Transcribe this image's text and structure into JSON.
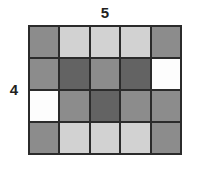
{
  "figure": {
    "kind": "rectangular-array-grid",
    "columns_label": "5",
    "rows_label": "4",
    "rows": 4,
    "columns": 5,
    "total_cells": 20,
    "gridline_color": "#2b2b2b",
    "background_color": "#ffffff",
    "label_color": "#231f20",
    "palette": {
      "white": "#fdfdfd",
      "light_gray": "#d2d2d2",
      "medium_gray": "#8c8c8c",
      "dark_gray": "#636363"
    },
    "cells": [
      [
        {
          "shade": "medium_gray",
          "color": "#8c8c8c"
        },
        {
          "shade": "light_gray",
          "color": "#d2d2d2"
        },
        {
          "shade": "light_gray",
          "color": "#d2d2d2"
        },
        {
          "shade": "light_gray",
          "color": "#d2d2d2"
        },
        {
          "shade": "medium_gray",
          "color": "#8c8c8c"
        }
      ],
      [
        {
          "shade": "medium_gray",
          "color": "#8c8c8c"
        },
        {
          "shade": "dark_gray",
          "color": "#636363"
        },
        {
          "shade": "medium_gray",
          "color": "#8c8c8c"
        },
        {
          "shade": "dark_gray",
          "color": "#636363"
        },
        {
          "shade": "white",
          "color": "#fdfdfd"
        }
      ],
      [
        {
          "shade": "white",
          "color": "#fdfdfd"
        },
        {
          "shade": "medium_gray",
          "color": "#8c8c8c"
        },
        {
          "shade": "dark_gray",
          "color": "#636363"
        },
        {
          "shade": "medium_gray",
          "color": "#8c8c8c"
        },
        {
          "shade": "medium_gray",
          "color": "#8c8c8c"
        }
      ],
      [
        {
          "shade": "medium_gray",
          "color": "#8c8c8c"
        },
        {
          "shade": "light_gray",
          "color": "#d2d2d2"
        },
        {
          "shade": "light_gray",
          "color": "#d2d2d2"
        },
        {
          "shade": "light_gray",
          "color": "#d2d2d2"
        },
        {
          "shade": "medium_gray",
          "color": "#8c8c8c"
        }
      ]
    ]
  }
}
